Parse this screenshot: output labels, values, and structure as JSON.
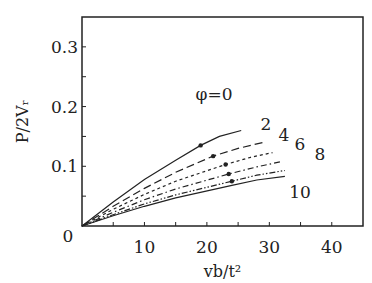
{
  "chart_data": {
    "type": "line",
    "title": "",
    "xlabel": "vb/t²",
    "ylabel": "P/2Vᵣ",
    "xlim": [
      0,
      45
    ],
    "ylim": [
      0,
      0.35
    ],
    "xticks": [
      "10",
      "20",
      "30",
      "40"
    ],
    "yticks": [
      "0.1",
      "0.2",
      "0.3"
    ],
    "origin_label": "0",
    "grid": false,
    "legend": "inline curve labels",
    "series": [
      {
        "name": "φ=0",
        "label": "φ=0",
        "style": "solid",
        "x": [
          0,
          5,
          10,
          15,
          19,
          22,
          25.5
        ],
        "y": [
          0,
          0.04,
          0.078,
          0.11,
          0.135,
          0.15,
          0.16
        ],
        "marker": {
          "x": 19,
          "y": 0.135
        }
      },
      {
        "name": "φ=2",
        "label": "2",
        "style": "long-dash",
        "x": [
          0,
          5,
          10,
          15,
          21,
          25,
          29
        ],
        "y": [
          0,
          0.033,
          0.063,
          0.09,
          0.117,
          0.13,
          0.14
        ],
        "marker": {
          "x": 21,
          "y": 0.117
        }
      },
      {
        "name": "φ=4",
        "label": "4",
        "style": "short-dash",
        "x": [
          0,
          5,
          10,
          15,
          23,
          27,
          30.5
        ],
        "y": [
          0,
          0.028,
          0.053,
          0.075,
          0.103,
          0.115,
          0.123
        ],
        "marker": {
          "x": 23,
          "y": 0.103
        }
      },
      {
        "name": "φ=6",
        "label": "6",
        "style": "dash-dot",
        "x": [
          0,
          5,
          10,
          15,
          23.5,
          28,
          32
        ],
        "y": [
          0,
          0.023,
          0.044,
          0.062,
          0.087,
          0.099,
          0.108
        ],
        "marker": {
          "x": 23.5,
          "y": 0.087
        }
      },
      {
        "name": "φ=8",
        "label": "8",
        "style": "dash-dot-dot",
        "x": [
          0,
          5,
          10,
          15,
          24,
          28,
          32.5
        ],
        "y": [
          0,
          0.019,
          0.037,
          0.052,
          0.075,
          0.085,
          0.093
        ],
        "marker": {
          "x": 24,
          "y": 0.075
        }
      },
      {
        "name": "φ=10",
        "label": "10",
        "style": "solid",
        "x": [
          0,
          5,
          10,
          15,
          24,
          28,
          32.5
        ],
        "y": [
          0,
          0.017,
          0.033,
          0.047,
          0.068,
          0.077,
          0.083
        ]
      }
    ]
  }
}
